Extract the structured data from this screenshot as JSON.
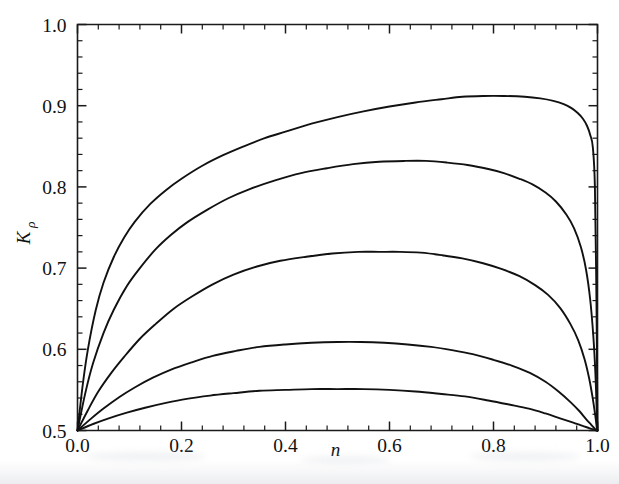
{
  "figure": {
    "background_color": "#ffffff",
    "line_color": "#111111",
    "axis_color": "#1a1a1a"
  },
  "chart_data": {
    "type": "line",
    "title": "",
    "subtitle": "",
    "xlabel": "n",
    "ylabel": "K",
    "ylabel_subscript": "ρ",
    "xlim": [
      0.0,
      1.0
    ],
    "ylim": [
      0.5,
      1.0
    ],
    "grid": false,
    "legend": "none",
    "x_major_ticks": [
      "0.0",
      "0.2",
      "0.4",
      "0.6",
      "0.8",
      "1.0"
    ],
    "x_major_tick_values": [
      0.0,
      0.2,
      0.4,
      0.6,
      0.8,
      1.0
    ],
    "x_minor_tick_step": 0.04,
    "y_major_ticks": [
      "0.5",
      "0.6",
      "0.7",
      "0.8",
      "0.9",
      "1.0"
    ],
    "y_major_tick_values": [
      0.5,
      0.6,
      0.7,
      0.8,
      0.9,
      1.0
    ],
    "y_minor_tick_step": 0.02,
    "tick_direction": "inward",
    "annotations": [],
    "series": [
      {
        "name": "curve-1",
        "peak_value": 0.912,
        "peak_x": 0.73,
        "endpoint_left": 0.5,
        "endpoint_right": 0.5,
        "x": [
          0.0,
          0.01,
          0.02,
          0.035,
          0.05,
          0.07,
          0.09,
          0.11,
          0.14,
          0.17,
          0.2,
          0.24,
          0.28,
          0.32,
          0.36,
          0.4,
          0.45,
          0.5,
          0.55,
          0.6,
          0.65,
          0.7,
          0.74,
          0.78,
          0.82,
          0.86,
          0.89,
          0.915,
          0.935,
          0.95,
          0.962,
          0.972,
          0.98,
          0.986,
          0.991,
          0.995,
          0.998,
          1.0
        ],
        "y": [
          0.5,
          0.556,
          0.6,
          0.648,
          0.682,
          0.714,
          0.738,
          0.757,
          0.779,
          0.796,
          0.81,
          0.826,
          0.839,
          0.85,
          0.86,
          0.868,
          0.878,
          0.886,
          0.893,
          0.899,
          0.904,
          0.908,
          0.911,
          0.912,
          0.912,
          0.911,
          0.909,
          0.906,
          0.902,
          0.897,
          0.891,
          0.884,
          0.875,
          0.864,
          0.849,
          0.8,
          0.66,
          0.5
        ]
      },
      {
        "name": "curve-2",
        "peak_value": 0.832,
        "peak_x": 0.66,
        "endpoint_left": 0.5,
        "endpoint_right": 0.5,
        "x": [
          0.0,
          0.015,
          0.03,
          0.05,
          0.07,
          0.095,
          0.12,
          0.15,
          0.18,
          0.21,
          0.25,
          0.29,
          0.33,
          0.38,
          0.43,
          0.48,
          0.53,
          0.58,
          0.63,
          0.67,
          0.71,
          0.75,
          0.79,
          0.82,
          0.85,
          0.875,
          0.9,
          0.92,
          0.94,
          0.955,
          0.968,
          0.978,
          0.986,
          0.992,
          0.996,
          0.999,
          1.0
        ],
        "y": [
          0.5,
          0.546,
          0.583,
          0.62,
          0.649,
          0.678,
          0.7,
          0.723,
          0.741,
          0.756,
          0.772,
          0.786,
          0.797,
          0.808,
          0.817,
          0.823,
          0.828,
          0.831,
          0.832,
          0.832,
          0.83,
          0.827,
          0.822,
          0.817,
          0.81,
          0.803,
          0.793,
          0.782,
          0.766,
          0.749,
          0.726,
          0.698,
          0.661,
          0.616,
          0.57,
          0.515,
          0.5
        ]
      },
      {
        "name": "curve-3",
        "peak_value": 0.72,
        "peak_x": 0.61,
        "endpoint_left": 0.5,
        "endpoint_right": 0.5,
        "x": [
          0.0,
          0.02,
          0.04,
          0.065,
          0.09,
          0.12,
          0.15,
          0.185,
          0.22,
          0.26,
          0.3,
          0.345,
          0.39,
          0.44,
          0.49,
          0.54,
          0.58,
          0.62,
          0.66,
          0.7,
          0.74,
          0.78,
          0.815,
          0.85,
          0.88,
          0.905,
          0.928,
          0.948,
          0.963,
          0.975,
          0.984,
          0.991,
          0.996,
          0.999,
          1.0
        ],
        "y": [
          0.5,
          0.525,
          0.548,
          0.571,
          0.591,
          0.613,
          0.631,
          0.65,
          0.665,
          0.68,
          0.692,
          0.702,
          0.709,
          0.714,
          0.718,
          0.72,
          0.72,
          0.72,
          0.719,
          0.716,
          0.712,
          0.706,
          0.699,
          0.69,
          0.679,
          0.667,
          0.651,
          0.631,
          0.611,
          0.588,
          0.564,
          0.539,
          0.517,
          0.502,
          0.5
        ]
      },
      {
        "name": "curve-4",
        "peak_value": 0.609,
        "peak_x": 0.57,
        "endpoint_left": 0.5,
        "endpoint_right": 0.5,
        "x": [
          0.0,
          0.025,
          0.05,
          0.08,
          0.11,
          0.145,
          0.18,
          0.22,
          0.26,
          0.305,
          0.35,
          0.4,
          0.45,
          0.5,
          0.545,
          0.59,
          0.635,
          0.68,
          0.72,
          0.76,
          0.8,
          0.835,
          0.87,
          0.9,
          0.925,
          0.948,
          0.965,
          0.978,
          0.988,
          0.995,
          0.999,
          1.0
        ],
        "y": [
          0.5,
          0.514,
          0.527,
          0.541,
          0.553,
          0.565,
          0.575,
          0.584,
          0.592,
          0.598,
          0.603,
          0.606,
          0.608,
          0.609,
          0.609,
          0.608,
          0.606,
          0.603,
          0.599,
          0.594,
          0.587,
          0.58,
          0.571,
          0.56,
          0.548,
          0.535,
          0.524,
          0.514,
          0.507,
          0.502,
          0.5,
          0.5
        ]
      },
      {
        "name": "curve-5",
        "peak_value": 0.551,
        "peak_x": 0.53,
        "endpoint_left": 0.5,
        "endpoint_right": 0.5,
        "x": [
          0.0,
          0.03,
          0.06,
          0.095,
          0.13,
          0.17,
          0.21,
          0.255,
          0.3,
          0.35,
          0.4,
          0.45,
          0.5,
          0.55,
          0.6,
          0.65,
          0.7,
          0.745,
          0.79,
          0.83,
          0.868,
          0.9,
          0.928,
          0.952,
          0.97,
          0.984,
          0.993,
          0.998,
          1.0
        ],
        "y": [
          0.5,
          0.508,
          0.515,
          0.522,
          0.528,
          0.534,
          0.539,
          0.543,
          0.546,
          0.549,
          0.55,
          0.551,
          0.551,
          0.551,
          0.55,
          0.548,
          0.545,
          0.542,
          0.537,
          0.532,
          0.527,
          0.521,
          0.515,
          0.51,
          0.506,
          0.503,
          0.501,
          0.5,
          0.5
        ]
      }
    ]
  }
}
